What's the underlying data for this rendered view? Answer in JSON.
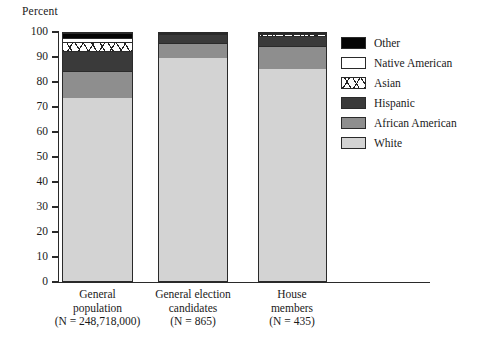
{
  "chart_data": {
    "type": "bar",
    "subtype": "stacked-100-percent",
    "title": "",
    "xlabel": "",
    "ylabel": "Percent",
    "ylim": [
      0,
      100
    ],
    "ytick_step": 10,
    "yticks": [
      100,
      90,
      80,
      70,
      60,
      50,
      40,
      30,
      20,
      10,
      0
    ],
    "grid": false,
    "legend_position": "right",
    "categories": [
      "General population",
      "General election candidates",
      "House members"
    ],
    "category_lines": [
      [
        "General",
        "population",
        "(N = 248,718,000)"
      ],
      [
        "General election",
        "candidates",
        "(N = 865)"
      ],
      [
        "House",
        "members",
        "(N = 435)"
      ]
    ],
    "series": [
      {
        "name": "White",
        "values": [
          74.0,
          90.0,
          85.5
        ]
      },
      {
        "name": "African American",
        "values": [
          11.0,
          6.0,
          9.5
        ]
      },
      {
        "name": "Hispanic",
        "values": [
          8.0,
          3.5,
          4.0
        ]
      },
      {
        "name": "Asian",
        "values": [
          3.5,
          0.3,
          0.6
        ]
      },
      {
        "name": "Native American",
        "values": [
          1.5,
          0.2,
          0.2
        ]
      },
      {
        "name": "Other",
        "values": [
          2.0,
          0.0,
          0.2
        ]
      }
    ],
    "legend": [
      {
        "name": "Other",
        "label": "Other",
        "fill": "#050505",
        "pattern": "solid"
      },
      {
        "name": "Native American",
        "label": "Native American",
        "fill": "#ffffff",
        "pattern": "solid"
      },
      {
        "name": "Asian",
        "label": "Asian",
        "fill": "#ffffff",
        "pattern": "hatch"
      },
      {
        "name": "Hispanic",
        "label": "Hispanic",
        "fill": "#3a3a3a",
        "pattern": "solid"
      },
      {
        "name": "African American",
        "label": "African American",
        "fill": "#8e8e8e",
        "pattern": "solid"
      },
      {
        "name": "White",
        "label": "White",
        "fill": "#d3d3d3",
        "pattern": "solid"
      }
    ]
  },
  "axis": {
    "y_title": "Percent"
  },
  "colors": {
    "white": "#d3d3d3",
    "african_american": "#8e8e8e",
    "hispanic": "#3a3a3a",
    "asian": "#ffffff",
    "native_american": "#ffffff",
    "other": "#050505",
    "axis": "#2a2a2a",
    "background": "#ffffff"
  }
}
